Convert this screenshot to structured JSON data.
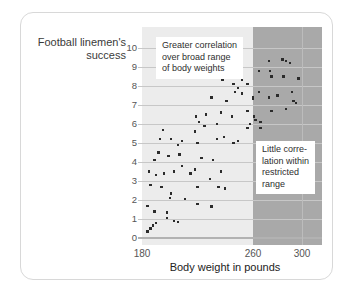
{
  "chart_data": {
    "type": "scatter",
    "title": "",
    "ylabel": "Football linemen's success",
    "ylabel_lines": [
      "Football linemen's",
      "success"
    ],
    "xlabel": "Body weight in pounds",
    "y_ticks": [
      0,
      1,
      2,
      3,
      4,
      5,
      6,
      7,
      8,
      9,
      10
    ],
    "x_ticks": [
      180,
      260,
      300
    ],
    "xlim": [
      180,
      316
    ],
    "ylim": [
      0,
      11
    ],
    "grid": "horizontal gridlines at every integer; faint vertical gridline at 300",
    "x_gridlines": [
      300
    ],
    "legend": "none",
    "regions": [
      {
        "name": "broad-range",
        "label": "broad range of body weights",
        "x_from": 180,
        "x_to": 260,
        "color": "#ececec"
      },
      {
        "name": "restricted-range",
        "label": "restricted range",
        "x_from": 260,
        "x_to": 316,
        "color": "#a9a9a9"
      }
    ],
    "annotations": [
      {
        "name": "broad-range-note",
        "lines": [
          "Greater correlation",
          "over broad range",
          "of body weights"
        ],
        "left": 156,
        "top": 37
      },
      {
        "name": "restricted-range-note",
        "lines": [
          "Little corre-",
          "lation within",
          "restricted",
          "range"
        ],
        "left": 256,
        "top": 141
      }
    ],
    "points": [
      [
        184,
        0.35
      ],
      [
        186,
        0.5
      ],
      [
        188,
        0.65
      ],
      [
        190,
        0.8
      ],
      [
        203,
        0.9
      ],
      [
        206,
        0.85
      ],
      [
        189,
        1.4
      ],
      [
        198,
        1.35
      ],
      [
        198,
        1.05
      ],
      [
        184,
        1.7
      ],
      [
        220,
        1.8
      ],
      [
        230,
        1.65
      ],
      [
        200,
        2.1
      ],
      [
        211,
        2.05
      ],
      [
        201,
        2.35
      ],
      [
        186,
        2.8
      ],
      [
        194,
        2.7
      ],
      [
        220,
        2.7
      ],
      [
        235,
        2.7
      ],
      [
        240,
        2.6
      ],
      [
        190,
        3.3
      ],
      [
        229,
        3.1
      ],
      [
        185,
        3.5
      ],
      [
        196,
        3.4
      ],
      [
        203,
        3.5
      ],
      [
        215,
        3.4
      ],
      [
        218,
        3.6
      ],
      [
        237,
        3.5
      ],
      [
        209,
        3.8
      ],
      [
        189,
        4.1
      ],
      [
        223,
        4.2
      ],
      [
        231,
        4.1
      ],
      [
        192,
        4.5
      ],
      [
        199,
        4.3
      ],
      [
        207,
        4.4
      ],
      [
        206,
        4.9
      ],
      [
        193,
        5.2
      ],
      [
        201,
        5.2
      ],
      [
        209,
        5.1
      ],
      [
        220,
        5.0
      ],
      [
        234,
        5.2
      ],
      [
        239,
        5.3
      ],
      [
        249,
        5.1
      ],
      [
        246,
        5.0
      ],
      [
        195,
        5.7
      ],
      [
        218,
        5.6
      ],
      [
        225,
        5.9
      ],
      [
        221,
        6.1
      ],
      [
        234,
        6.0
      ],
      [
        256,
        5.8
      ],
      [
        266,
        5.8
      ],
      [
        258,
        6.0
      ],
      [
        262,
        6.2
      ],
      [
        266,
        6.1
      ],
      [
        219,
        6.4
      ],
      [
        226,
        6.5
      ],
      [
        237,
        6.6
      ],
      [
        245,
        6.4
      ],
      [
        261,
        6.4
      ],
      [
        256,
        6.7
      ],
      [
        275,
        6.7
      ],
      [
        287,
        6.8
      ],
      [
        230,
        7.4
      ],
      [
        241,
        7.2
      ],
      [
        247,
        7.7
      ],
      [
        252,
        7.6
      ],
      [
        260,
        7.3
      ],
      [
        265,
        7.7
      ],
      [
        260,
        7.4
      ],
      [
        273,
        7.4
      ],
      [
        280,
        7.5
      ],
      [
        292,
        7.7
      ],
      [
        293,
        7.2
      ],
      [
        295,
        7.1
      ],
      [
        249,
        7.9
      ],
      [
        238,
        8.3
      ],
      [
        246,
        8.1
      ],
      [
        252,
        8.3
      ],
      [
        256,
        8.1
      ],
      [
        297,
        8.4
      ],
      [
        285,
        8.5
      ],
      [
        275,
        8.5
      ],
      [
        265,
        8.8
      ],
      [
        274,
        8.8
      ],
      [
        273,
        9.3
      ],
      [
        284,
        9.4
      ],
      [
        287,
        9.3
      ],
      [
        290,
        9.2
      ]
    ]
  },
  "colors": {
    "card_border": "#d8d8d8",
    "broad_region": "#ececec",
    "restricted_region": "#a9a9a9",
    "gridline": "#c7c7c7",
    "baseline": "#b2b2b2",
    "vertical_gridline": "#bcbcbc",
    "point": "#2b2b2b",
    "note_bg": "#ffffff",
    "note_text": "#2e2e2e",
    "tick_text": "#555555",
    "axis_text": "#222222",
    "title_text": "#3a3a3a"
  }
}
